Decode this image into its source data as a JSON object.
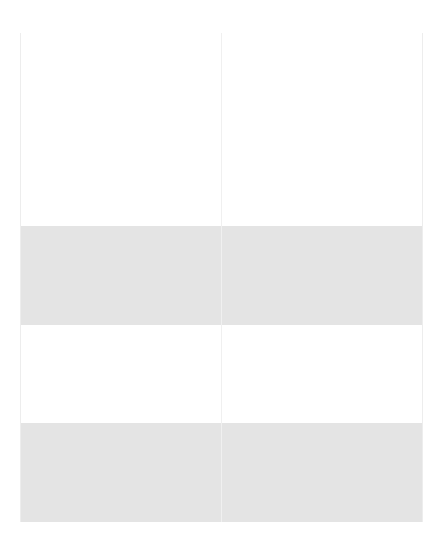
{
  "page": {
    "background_color": "#ffffff",
    "width": 442,
    "height": 559
  },
  "table": {
    "border_color": "#ededed",
    "shaded_row_color": "#e4e4e4",
    "plain_row_color": "#ffffff",
    "column_count": 2,
    "row_count": 5,
    "columns": [
      {
        "id": "col-1",
        "header": "",
        "width_px": 200
      },
      {
        "id": "col-2",
        "header": "",
        "width_px": 200
      }
    ],
    "rows": [
      {
        "id": "row-1",
        "shaded": false,
        "height_px": 99,
        "cells": [
          "",
          ""
        ]
      },
      {
        "id": "row-2",
        "shaded": false,
        "height_px": 94,
        "cells": [
          "",
          ""
        ]
      },
      {
        "id": "row-3",
        "shaded": true,
        "height_px": 99,
        "cells": [
          "",
          ""
        ]
      },
      {
        "id": "row-4",
        "shaded": false,
        "height_px": 98,
        "cells": [
          "",
          ""
        ]
      },
      {
        "id": "row-5",
        "shaded": true,
        "height_px": 99,
        "cells": [
          "",
          ""
        ]
      }
    ]
  }
}
